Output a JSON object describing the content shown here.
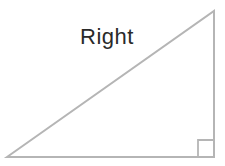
{
  "figure": {
    "type": "right-triangle-diagram",
    "label": "Right"
  },
  "colors": {
    "background": "#ffffff",
    "triangle_stroke": "#b5b5b5",
    "label_text": "#2a2a2a"
  },
  "geometry": {
    "triangle_points": "7,157 214,11 214,157",
    "right_angle_marker_points": "198,156 198,140 214,140",
    "label_x": "107",
    "label_y": "44"
  }
}
